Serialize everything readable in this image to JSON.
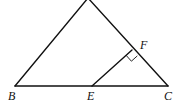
{
  "diagram": {
    "type": "geometry",
    "points": {
      "B": {
        "label": "B",
        "x": 15,
        "y": 86
      },
      "E": {
        "label": "E",
        "x": 92,
        "y": 86
      },
      "C": {
        "label": "C",
        "x": 168,
        "y": 86
      },
      "F": {
        "label": "F",
        "x": 132,
        "y": 50
      },
      "apex": {
        "label": "",
        "x": 88,
        "y": -2
      }
    },
    "segments": [
      [
        "B",
        "C"
      ],
      [
        "B",
        "apex"
      ],
      [
        "apex",
        "C"
      ],
      [
        "E",
        "F"
      ]
    ],
    "right_angle_at": "F",
    "labels": {
      "B": "B",
      "E": "E",
      "C": "C",
      "F": "F"
    }
  }
}
